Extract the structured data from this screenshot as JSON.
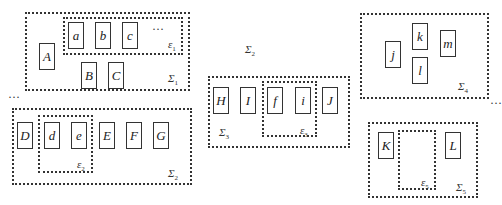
{
  "diagram": {
    "top_label": {
      "symbol": "Σ",
      "sub": "2"
    },
    "ellipses": [
      "···",
      "···",
      "···"
    ],
    "groups": {
      "sigma1": {
        "label": {
          "symbol": "Σ",
          "sub": "1"
        },
        "nodes": [
          "A",
          "B",
          "C"
        ],
        "inner": {
          "label": {
            "symbol": "ε",
            "sub": "1"
          },
          "nodes": [
            "a",
            "b",
            "c"
          ],
          "trailing": "···"
        }
      },
      "sigma2": {
        "label": {
          "symbol": "Σ",
          "sub": "2"
        },
        "nodes": [
          "D",
          "E",
          "F",
          "G"
        ],
        "inner": {
          "label": {
            "symbol": "ε",
            "sub": "2"
          },
          "nodes": [
            "d",
            "e"
          ]
        }
      },
      "sigma3": {
        "label": {
          "symbol": "Σ",
          "sub": "3"
        },
        "nodes": [
          "H",
          "I",
          "J"
        ],
        "inner": {
          "label": {
            "symbol": "ε",
            "sub": "3"
          },
          "nodes": [
            "f",
            "i"
          ]
        }
      },
      "sigma4": {
        "label": {
          "symbol": "Σ",
          "sub": "4"
        },
        "nodes": [
          "j",
          "k",
          "l",
          "m"
        ]
      },
      "sigma5": {
        "label": {
          "symbol": "Σ",
          "sub": "5"
        },
        "nodes": [
          "K",
          "L"
        ],
        "inner": {
          "label": {
            "symbol": "ε",
            "sub": "5"
          },
          "nodes": []
        }
      }
    }
  }
}
